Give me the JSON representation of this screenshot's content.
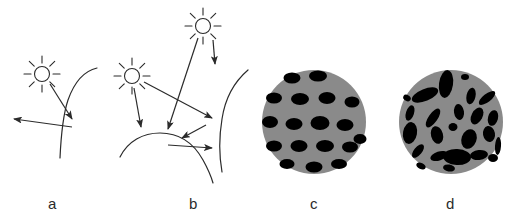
{
  "figure": {
    "background_color": "#ffffff",
    "width": 529,
    "height": 224,
    "ink_color": "#2b2b2b",
    "sphere_fill_color": "#8a8a8a",
    "pore_fill_color": "#000000"
  },
  "captions": {
    "a": "a",
    "b": "b",
    "c": "c",
    "d": "d"
  },
  "panels": [
    {
      "id": "a",
      "caption": "a",
      "description": "single sun with one incident ray reflecting off a curved surface into one outgoing ray",
      "suns": 1,
      "incident_arrows": 1,
      "outgoing_arrows": 1,
      "surfaces": 1
    },
    {
      "id": "b",
      "caption": "b",
      "description": "two suns with multiple incident rays undergoing multiple reflections between two curved surfaces forming a groove",
      "suns": 2,
      "incident_arrows": 3,
      "outgoing_arrows": 2,
      "surfaces": 2
    },
    {
      "id": "c",
      "caption": "c",
      "description": "gray circle containing regularly spaced uniform horizontal elliptical pores",
      "pore_count": 19,
      "pore_arrangement": "regular lattice",
      "pore_orientation": "uniform horizontal"
    },
    {
      "id": "d",
      "caption": "d",
      "description": "gray circle containing randomly oriented elliptical pores of varied size",
      "pore_count": 24,
      "pore_arrangement": "random",
      "pore_orientation": "random"
    }
  ],
  "geometry": {
    "sun_a": {
      "cx": 42,
      "cy": 74,
      "r": 7.5,
      "rays": 8,
      "ray_inner": 11,
      "ray_outer": 18
    },
    "sun_b_left": {
      "cx": 132,
      "cy": 76,
      "r": 7.5,
      "rays": 8,
      "ray_inner": 11,
      "ray_outer": 18
    },
    "sun_b_top": {
      "cx": 203,
      "cy": 26,
      "r": 7.5,
      "rays": 8,
      "ray_inner": 11,
      "ray_outer": 18
    },
    "circle_c": {
      "cx": 314,
      "cy": 122,
      "r": 52
    },
    "circle_d": {
      "cx": 451,
      "cy": 122,
      "r": 52
    },
    "pores_c": [
      {
        "cx": -22,
        "cy": -44,
        "rx": 8.5,
        "ry": 5.5,
        "rot": 0
      },
      {
        "cx": 4,
        "cy": -46,
        "rx": 9,
        "ry": 5.5,
        "rot": 0
      },
      {
        "cx": -40,
        "cy": -24,
        "rx": 8,
        "ry": 5.5,
        "rot": 0
      },
      {
        "cx": -14,
        "cy": -23,
        "rx": 9,
        "ry": 6,
        "rot": 0
      },
      {
        "cx": 13,
        "cy": -24,
        "rx": 8.5,
        "ry": 6,
        "rot": 0
      },
      {
        "cx": 38,
        "cy": -20,
        "rx": 7.5,
        "ry": 5.5,
        "rot": 0
      },
      {
        "cx": -44,
        "cy": 0,
        "rx": 8,
        "ry": 6,
        "rot": 0
      },
      {
        "cx": -20,
        "cy": 2,
        "rx": 8.5,
        "ry": 6,
        "rot": 0
      },
      {
        "cx": 6,
        "cy": 1,
        "rx": 9.5,
        "ry": 7,
        "rot": 0
      },
      {
        "cx": 31,
        "cy": 3,
        "rx": 8.5,
        "ry": 6,
        "rot": 0
      },
      {
        "cx": 46,
        "cy": 17,
        "rx": 6.5,
        "ry": 5,
        "rot": 0
      },
      {
        "cx": -40,
        "cy": 24,
        "rx": 8,
        "ry": 5.5,
        "rot": 0
      },
      {
        "cx": -15,
        "cy": 24,
        "rx": 8.5,
        "ry": 6,
        "rot": 0
      },
      {
        "cx": 11,
        "cy": 24,
        "rx": 9,
        "ry": 6,
        "rot": 0
      },
      {
        "cx": 36,
        "cy": 25,
        "rx": 8,
        "ry": 5.5,
        "rot": 0
      },
      {
        "cx": -27,
        "cy": 42,
        "rx": 7.5,
        "ry": 5,
        "rot": 0
      },
      {
        "cx": 0,
        "cy": 45,
        "rx": 8.5,
        "ry": 5.5,
        "rot": 0
      },
      {
        "cx": 25,
        "cy": 42,
        "rx": 8,
        "ry": 5,
        "rot": 0
      },
      {
        "cx": -2,
        "cy": -8,
        "rx": 2,
        "ry": 2,
        "rot": 0
      }
    ],
    "pores_d": [
      {
        "cx": -5,
        "cy": -38,
        "rx": 7,
        "ry": 14,
        "rot": 8
      },
      {
        "cx": -26,
        "cy": -27,
        "rx": 14,
        "ry": 6,
        "rot": -22
      },
      {
        "cx": 20,
        "cy": -26,
        "rx": 4.5,
        "ry": 8.5,
        "rot": 12
      },
      {
        "cx": 36,
        "cy": -24,
        "rx": 10,
        "ry": 4,
        "rot": -38
      },
      {
        "cx": -41,
        "cy": -9,
        "rx": 4,
        "ry": 8,
        "rot": 18
      },
      {
        "cx": -18,
        "cy": -4,
        "rx": 4.5,
        "ry": 11,
        "rot": 35
      },
      {
        "cx": 8,
        "cy": -10,
        "rx": 5,
        "ry": 8,
        "rot": -8
      },
      {
        "cx": 26,
        "cy": -6,
        "rx": 5.5,
        "ry": 9,
        "rot": 28
      },
      {
        "cx": 42,
        "cy": -4,
        "rx": 5,
        "ry": 8,
        "rot": 15
      },
      {
        "cx": -41,
        "cy": 11,
        "rx": 7,
        "ry": 11,
        "rot": 10
      },
      {
        "cx": -14,
        "cy": 13,
        "rx": 6,
        "ry": 9,
        "rot": -15
      },
      {
        "cx": 2,
        "cy": 5,
        "rx": 4.5,
        "ry": 4,
        "rot": 0
      },
      {
        "cx": 18,
        "cy": 17,
        "rx": 7.5,
        "ry": 10,
        "rot": 20
      },
      {
        "cx": 38,
        "cy": 12,
        "rx": 6,
        "ry": 8,
        "rot": -10
      },
      {
        "cx": 47,
        "cy": 24,
        "rx": 3,
        "ry": 9,
        "rot": 4
      },
      {
        "cx": -33,
        "cy": 29,
        "rx": 4,
        "ry": 8,
        "rot": 40
      },
      {
        "cx": -12,
        "cy": 34,
        "rx": 9,
        "ry": 4.5,
        "rot": -18
      },
      {
        "cx": 6,
        "cy": 35,
        "rx": 14,
        "ry": 8,
        "rot": 3
      },
      {
        "cx": 28,
        "cy": 33,
        "rx": 9,
        "ry": 5,
        "rot": -6
      },
      {
        "cx": 42,
        "cy": 36,
        "rx": 5,
        "ry": 4,
        "rot": 0
      },
      {
        "cx": -2,
        "cy": 46,
        "rx": 6,
        "ry": 3.5,
        "rot": 10
      },
      {
        "cx": -30,
        "cy": 44,
        "rx": 5,
        "ry": 3,
        "rot": 25
      },
      {
        "cx": 14,
        "cy": -45,
        "rx": 4,
        "ry": 3,
        "rot": 0
      },
      {
        "cx": -44,
        "cy": -24,
        "rx": 4,
        "ry": 3,
        "rot": 30
      }
    ]
  }
}
